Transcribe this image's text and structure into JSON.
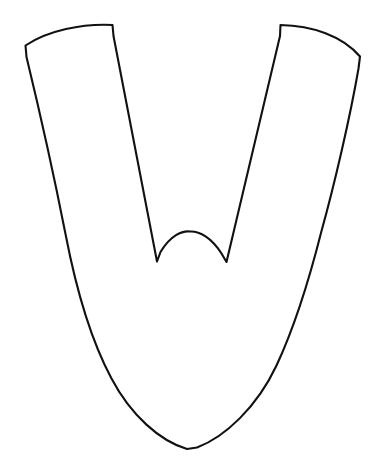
{
  "document": {
    "title": "Line drawing figure",
    "background_color": "#ffffff",
    "width": 378,
    "height": 469
  },
  "figure": {
    "name": "tulip-shaped-outline",
    "stroke_color": "#111111",
    "fill_color": "#ffffff",
    "stroke_width": 2.1,
    "symmetry": "bilateral-vertical",
    "axis_of_symmetry_x": 190,
    "key_points": {
      "top_left_outer_corner": [
        25,
        45
      ],
      "top_left_inner_corner": [
        112,
        25
      ],
      "top_right_inner_corner": [
        281,
        25
      ],
      "top_right_outer_corner": [
        360,
        57
      ],
      "notch_left_spike": [
        157,
        262
      ],
      "notch_arch_apex": [
        190,
        232
      ],
      "notch_right_spike": [
        227,
        262
      ],
      "bottom_point": [
        187,
        449
      ],
      "left_widest": [
        64,
        228
      ],
      "right_widest": [
        322,
        230
      ]
    },
    "outline_path": "M 25.5 45.5 C 48 30.5 82 23.5 112.5 25.0 L 113.5 36.0 L 157.0 261.5 L 160.5 252.0 C 170.5 235.5 182.0 230.5 190.0 231.5 C 199.5 231.0 211.5 237.5 221.5 253.5 L 226.5 262.0 L 280.0 36.0 L 280.5 25.0 C 312.0 25.5 342.5 36.0 360.0 56.5 L 358.5 68.5 C 350.0 118.0 334.0 186.0 321.5 231.0 C 309.5 278.5 295.0 326.0 276.5 365.5 C 257.0 407.0 225.0 437.0 197.0 447.5 L 187.0 449.0 C 160.0 441.0 131.0 415.5 111.5 378.5 C 90.0 338.5 76.0 288.5 65.5 234.0 C 54.0 175.5 38.0 104.5 26.5 57.0 Z"
  },
  "caption": {
    "text": "",
    "visible": false,
    "note": "partially cropped text at bottom edge, illegible"
  }
}
